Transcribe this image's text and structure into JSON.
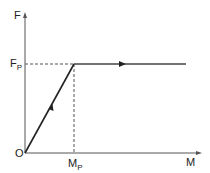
{
  "diagram": {
    "y_axis_label": "F",
    "x_axis_label": "M",
    "origin_label": "O",
    "fp_label": {
      "main": "F",
      "sub": "P"
    },
    "mp_label": {
      "main": "M",
      "sub": "P"
    },
    "line_color": "#222222"
  }
}
